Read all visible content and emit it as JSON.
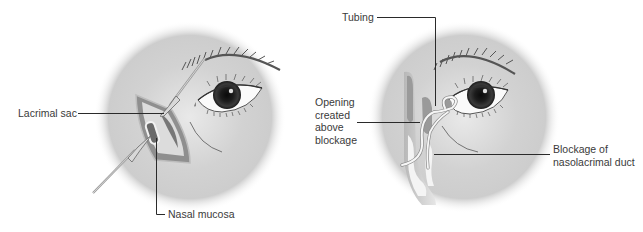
{
  "figure": {
    "panels": [
      {
        "id": "left",
        "description": "External dacryocystorhinostomy incision with retractors",
        "labels": {
          "lacrimal_sac": "Lacrimal sac",
          "nasal_mucosa": "Nasal mucosa"
        }
      },
      {
        "id": "right",
        "description": "Tubing placed through new opening bypassing blockage",
        "labels": {
          "tubing": "Tubing",
          "opening": "Opening created above blockage",
          "opening_lines": [
            "Opening",
            "created",
            "above",
            "blockage"
          ],
          "blockage_lines": [
            "Blockage of",
            "nasolacrimal duct"
          ]
        }
      }
    ],
    "colors": {
      "background": "#ffffff",
      "face_shade": "#c8c8c8",
      "leader_line": "#2a2a2a",
      "text": "#3a3a3a",
      "iris": "#1e1e1e"
    }
  }
}
